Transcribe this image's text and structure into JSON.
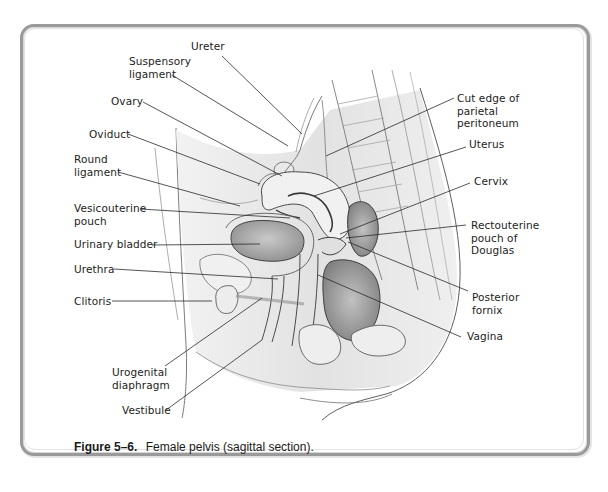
{
  "figure": {
    "number": "Figure 5–6.",
    "caption": "Female pelvis (sagittal section)."
  },
  "labels": [
    {
      "id": "ureter",
      "text": "Ureter",
      "x": 191,
      "y": 40,
      "line": [
        [
          222,
          56
        ],
        [
          302,
          134
        ]
      ]
    },
    {
      "id": "suspensory-ligament",
      "text": "Suspensory\nligament",
      "x": 129,
      "y": 55,
      "line": [
        [
          172,
          75
        ],
        [
          288,
          146
        ]
      ]
    },
    {
      "id": "ovary",
      "text": "Ovary",
      "x": 111,
      "y": 95,
      "line": [
        [
          143,
          102
        ],
        [
          282,
          176
        ]
      ]
    },
    {
      "id": "oviduct",
      "text": "Oviduct",
      "x": 89,
      "y": 128,
      "line": [
        [
          128,
          134
        ],
        [
          260,
          184
        ]
      ]
    },
    {
      "id": "round-ligament",
      "text": "Round\nligament",
      "x": 74,
      "y": 153,
      "line": [
        [
          118,
          172
        ],
        [
          240,
          206
        ]
      ]
    },
    {
      "id": "vesicouterine-pouch",
      "text": "Vesicouterine\npouch",
      "x": 74,
      "y": 202,
      "line": [
        [
          140,
          209
        ],
        [
          290,
          218
        ]
      ]
    },
    {
      "id": "urinary-bladder",
      "text": "Urinary bladder",
      "x": 74,
      "y": 238,
      "line": [
        [
          152,
          245
        ],
        [
          260,
          244
        ]
      ]
    },
    {
      "id": "urethra",
      "text": "Urethra",
      "x": 74,
      "y": 263,
      "line": [
        [
          114,
          269
        ],
        [
          278,
          279
        ]
      ]
    },
    {
      "id": "clitoris",
      "text": "Clitoris",
      "x": 74,
      "y": 295,
      "line": [
        [
          112,
          301
        ],
        [
          212,
          301
        ]
      ]
    },
    {
      "id": "urogenital-diaphragm",
      "text": "Urogenital\ndiaphragm",
      "x": 112,
      "y": 366,
      "line": [
        [
          165,
          366
        ],
        [
          262,
          298
        ]
      ]
    },
    {
      "id": "vestibule",
      "text": "Vestibule",
      "x": 122,
      "y": 404,
      "line": [
        [
          166,
          410
        ],
        [
          262,
          340
        ]
      ]
    },
    {
      "id": "cut-edge-parietal-peritoneum",
      "text": "Cut edge of\nparietal\nperitoneum",
      "x": 457,
      "y": 92,
      "line": [
        [
          454,
          98
        ],
        [
          326,
          156
        ]
      ]
    },
    {
      "id": "uterus",
      "text": "Uterus",
      "x": 469,
      "y": 138,
      "line": [
        [
          466,
          147
        ],
        [
          314,
          196
        ]
      ]
    },
    {
      "id": "cervix",
      "text": "Cervix",
      "x": 474,
      "y": 175,
      "line": [
        [
          470,
          183
        ],
        [
          340,
          234
        ]
      ]
    },
    {
      "id": "rectouterine-pouch",
      "text": "Rectouterine\npouch of\nDouglas",
      "x": 471,
      "y": 219,
      "line": [
        [
          466,
          225
        ],
        [
          346,
          238
        ]
      ]
    },
    {
      "id": "posterior-fornix",
      "text": "Posterior\nfornix",
      "x": 472,
      "y": 291,
      "line": [
        [
          468,
          291
        ],
        [
          348,
          242
        ]
      ]
    },
    {
      "id": "vagina",
      "text": "Vagina",
      "x": 467,
      "y": 330,
      "line": [
        [
          461,
          337
        ],
        [
          318,
          275
        ]
      ]
    }
  ],
  "colors": {
    "frame": "#9a9a9a",
    "leader": "#2a2a2a",
    "ink": "#4a4a4a",
    "shade": "#bdbdbd"
  }
}
